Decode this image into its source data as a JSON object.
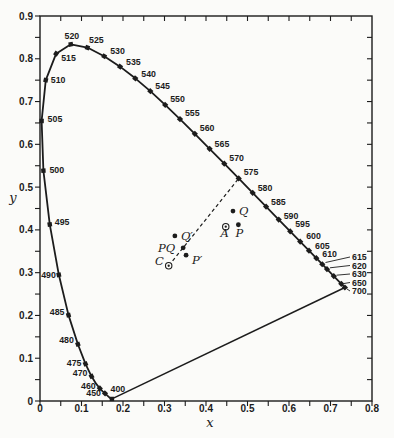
{
  "figure": {
    "bg": "#fbfbf9",
    "ink": "#1c1c1c"
  },
  "chart_data": {
    "type": "line",
    "title": "",
    "xlabel": "x",
    "ylabel": "y",
    "xlim": [
      0,
      0.8
    ],
    "ylim": [
      0,
      0.9
    ],
    "grid": false,
    "minor_tick_step": 0.05,
    "x_tick_labels": [
      "0",
      "0.1",
      "0.2",
      "0.3",
      "0.4",
      "0.5",
      "0.6",
      "0.7",
      "0.8"
    ],
    "y_tick_labels": [
      "0",
      "0.1",
      "0.2",
      "0.3",
      "0.4",
      "0.5",
      "0.6",
      "0.7",
      "0.8",
      "0.9"
    ],
    "spectral_locus": [
      [
        400,
        0.1733,
        0.0048
      ],
      [
        410,
        0.1726,
        0.0048
      ],
      [
        420,
        0.1714,
        0.0051
      ],
      [
        430,
        0.1689,
        0.0069
      ],
      [
        440,
        0.1644,
        0.0109
      ],
      [
        450,
        0.1566,
        0.0177
      ],
      [
        455,
        0.151,
        0.0227
      ],
      [
        460,
        0.144,
        0.0297
      ],
      [
        465,
        0.1355,
        0.0399
      ],
      [
        470,
        0.1241,
        0.0578
      ],
      [
        475,
        0.1096,
        0.0868
      ],
      [
        480,
        0.0913,
        0.1327
      ],
      [
        485,
        0.0687,
        0.2007
      ],
      [
        490,
        0.0454,
        0.295
      ],
      [
        495,
        0.0235,
        0.4127
      ],
      [
        500,
        0.0082,
        0.5384
      ],
      [
        505,
        0.0039,
        0.6548
      ],
      [
        510,
        0.0139,
        0.7502
      ],
      [
        515,
        0.0389,
        0.812
      ],
      [
        520,
        0.0743,
        0.8338
      ],
      [
        525,
        0.1142,
        0.8262
      ],
      [
        530,
        0.1547,
        0.8059
      ],
      [
        535,
        0.1929,
        0.7816
      ],
      [
        540,
        0.2296,
        0.7543
      ],
      [
        545,
        0.2658,
        0.7243
      ],
      [
        550,
        0.3016,
        0.6923
      ],
      [
        555,
        0.3373,
        0.6589
      ],
      [
        560,
        0.3731,
        0.6245
      ],
      [
        565,
        0.4087,
        0.5896
      ],
      [
        570,
        0.4441,
        0.5547
      ],
      [
        575,
        0.4788,
        0.5202
      ],
      [
        580,
        0.5125,
        0.4866
      ],
      [
        585,
        0.5448,
        0.4544
      ],
      [
        590,
        0.5752,
        0.4242
      ],
      [
        595,
        0.6029,
        0.3965
      ],
      [
        600,
        0.627,
        0.3725
      ],
      [
        605,
        0.6482,
        0.3514
      ],
      [
        610,
        0.6658,
        0.334
      ],
      [
        615,
        0.6801,
        0.3197
      ],
      [
        620,
        0.6915,
        0.3083
      ],
      [
        630,
        0.7079,
        0.292
      ],
      [
        650,
        0.726,
        0.274
      ],
      [
        700,
        0.7347,
        0.2653
      ]
    ],
    "marker_wavelengths": [
      400,
      450,
      460,
      470,
      475,
      480,
      485,
      490,
      495,
      500,
      505,
      510,
      515,
      520,
      525,
      530,
      535,
      540,
      545,
      550,
      555,
      560,
      565,
      570,
      575,
      580,
      585,
      590,
      595,
      600,
      605,
      610,
      615,
      620,
      630,
      650,
      700
    ],
    "wavelength_labels": [
      {
        "wl": 400,
        "text": "400",
        "anchor": "middle",
        "dx": 6,
        "dy": -7
      },
      {
        "wl": 450,
        "text": "450",
        "anchor": "end",
        "dx": -4,
        "dy": 3
      },
      {
        "wl": 460,
        "text": "460",
        "anchor": "end",
        "dx": -4,
        "dy": 1
      },
      {
        "wl": 470,
        "text": "470",
        "anchor": "end",
        "dx": -4,
        "dy": 0
      },
      {
        "wl": 475,
        "text": "475",
        "anchor": "end",
        "dx": -4,
        "dy": 2
      },
      {
        "wl": 480,
        "text": "480",
        "anchor": "end",
        "dx": -4,
        "dy": -1
      },
      {
        "wl": 485,
        "text": "485",
        "anchor": "end",
        "dx": -4,
        "dy": 0
      },
      {
        "wl": 490,
        "text": "490",
        "anchor": "end",
        "dx": -3,
        "dy": 3
      },
      {
        "wl": 495,
        "text": "495",
        "anchor": "start",
        "dx": 5,
        "dy": 1
      },
      {
        "wl": 500,
        "text": "500",
        "anchor": "start",
        "dx": 6,
        "dy": 2
      },
      {
        "wl": 505,
        "text": "505",
        "anchor": "start",
        "dx": 6,
        "dy": 1
      },
      {
        "wl": 510,
        "text": "510",
        "anchor": "start",
        "dx": 5,
        "dy": 3
      },
      {
        "wl": 515,
        "text": "515",
        "anchor": "start",
        "dx": 5,
        "dy": 7
      },
      {
        "wl": 520,
        "text": "520",
        "anchor": "middle",
        "dx": 1,
        "dy": -5
      },
      {
        "wl": 525,
        "text": "525",
        "anchor": "middle",
        "dx": 9,
        "dy": -5
      },
      {
        "wl": 530,
        "text": "530",
        "anchor": "start",
        "dx": 6,
        "dy": -2
      },
      {
        "wl": 535,
        "text": "535",
        "anchor": "start",
        "dx": 6,
        "dy": -2
      },
      {
        "wl": 540,
        "text": "540",
        "anchor": "start",
        "dx": 6,
        "dy": -1
      },
      {
        "wl": 545,
        "text": "545",
        "anchor": "start",
        "dx": 5,
        "dy": -2
      },
      {
        "wl": 550,
        "text": "550",
        "anchor": "start",
        "dx": 5,
        "dy": -3
      },
      {
        "wl": 555,
        "text": "555",
        "anchor": "start",
        "dx": 5,
        "dy": -3
      },
      {
        "wl": 560,
        "text": "560",
        "anchor": "start",
        "dx": 5,
        "dy": -3
      },
      {
        "wl": 565,
        "text": "565",
        "anchor": "start",
        "dx": 5,
        "dy": -2
      },
      {
        "wl": 570,
        "text": "570",
        "anchor": "start",
        "dx": 5,
        "dy": -3
      },
      {
        "wl": 575,
        "text": "575",
        "anchor": "start",
        "dx": 5,
        "dy": -3
      },
      {
        "wl": 580,
        "text": "580",
        "anchor": "start",
        "dx": 5,
        "dy": -2
      },
      {
        "wl": 585,
        "text": "585",
        "anchor": "start",
        "dx": 5,
        "dy": -2
      },
      {
        "wl": 590,
        "text": "590",
        "anchor": "start",
        "dx": 5,
        "dy": -1
      },
      {
        "wl": 595,
        "text": "595",
        "anchor": "start",
        "dx": 5,
        "dy": -4
      },
      {
        "wl": 600,
        "text": "600",
        "anchor": "start",
        "dx": 6,
        "dy": -3
      },
      {
        "wl": 605,
        "text": "605",
        "anchor": "start",
        "dx": 6,
        "dy": -2
      },
      {
        "wl": 610,
        "text": "610",
        "anchor": "start",
        "dx": 6,
        "dy": -1
      }
    ],
    "leader_labels": [
      {
        "text": "615",
        "from": [
          325.5,
          262.5
        ],
        "to": [
          350,
          257
        ],
        "lx": 352,
        "ly": 260
      },
      {
        "text": "620",
        "from": [
          330,
          267.8
        ],
        "to": [
          350,
          265.5
        ],
        "lx": 352,
        "ly": 268.5
      },
      {
        "text": "630",
        "from": [
          336.5,
          275.2
        ],
        "to": [
          350,
          274
        ],
        "lx": 352,
        "ly": 277
      },
      {
        "text": "650",
        "from": [
          344,
          283.5
        ],
        "to": [
          350,
          282.5
        ],
        "lx": 352,
        "ly": 285.5
      },
      {
        "text": "700",
        "from": [
          347,
          289
        ],
        "to": [
          350,
          291
        ],
        "lx": 352,
        "ly": 294
      }
    ],
    "purple_line": [
      [
        0.1733,
        0.0048
      ],
      [
        0.7347,
        0.2653
      ]
    ],
    "dashed_line": {
      "from_label": "C",
      "to_wavelength": 575,
      "points": [
        [
          0.3101,
          0.3162
        ],
        [
          0.4788,
          0.5202
        ]
      ]
    },
    "special_points": [
      {
        "label": "Q",
        "x": 0.465,
        "y": 0.444,
        "marker": "dot",
        "anchor": "start",
        "dx": 6,
        "dy": 4
      },
      {
        "label": "A",
        "x": 0.4476,
        "y": 0.4074,
        "marker": "circle-dot",
        "anchor": "middle",
        "dx": -1,
        "dy": 10
      },
      {
        "label": "P",
        "x": 0.478,
        "y": 0.412,
        "marker": "dot",
        "anchor": "middle",
        "dx": 1,
        "dy": 12
      },
      {
        "label": "Q′",
        "x": 0.325,
        "y": 0.386,
        "marker": "dot",
        "anchor": "start",
        "dx": 6,
        "dy": 4
      },
      {
        "label": "PQ",
        "x": 0.345,
        "y": 0.358,
        "marker": "dot",
        "anchor": "end",
        "dx": -8,
        "dy": 4
      },
      {
        "label": "P′",
        "x": 0.352,
        "y": 0.341,
        "marker": "dot",
        "anchor": "start",
        "dx": 6,
        "dy": 9
      },
      {
        "label": "C",
        "x": 0.3101,
        "y": 0.3162,
        "marker": "circle-dot",
        "anchor": "end",
        "dx": -5,
        "dy": -1
      }
    ]
  }
}
